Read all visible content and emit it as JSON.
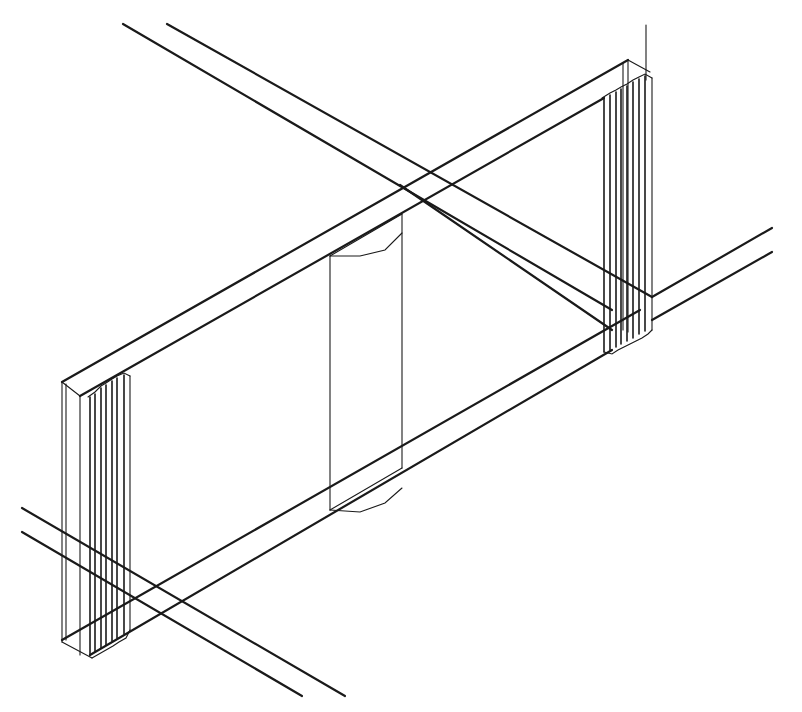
{
  "drawing": {
    "type": "isometric-wireframe",
    "description": "CAD wireframe of a beam with rebar columns at both ends, a central cylindrical element and crossing rebars",
    "stroke_color": "#1a1a1a",
    "background": "#ffffff"
  }
}
